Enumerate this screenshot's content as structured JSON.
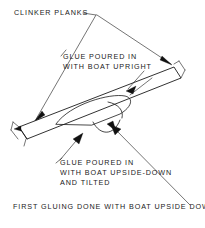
{
  "diagram": {
    "ink_color": "#1b1b1b",
    "background_color": "#ffffff",
    "annotations": {
      "clinker_planks": "CLINKER PLANKS",
      "glue_upright_line1": "GLUE POURED IN",
      "glue_upright_line2": "WITH BOAT UPRIGHT",
      "glue_upsidedown_line1": "GLUE POURED IN",
      "glue_upsidedown_line2": "WITH BOAT UPSIDE-DOWN",
      "glue_upsidedown_line3": "AND TILTED",
      "caption": "FIRST GLUING DONE WITH BOAT UPSIDE DOWN"
    }
  }
}
